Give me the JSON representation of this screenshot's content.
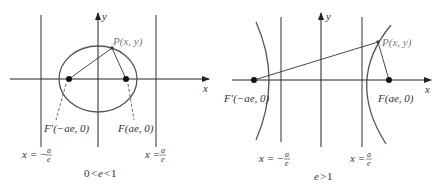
{
  "left_panel": {
    "caption": "0 < e < 1",
    "caption_parts": {
      "zero": "0",
      "lt1": "<",
      "e": "e",
      "lt2": "<",
      "one": "1"
    },
    "x_axis_label": "x",
    "y_axis_label": "y",
    "point_label": "P(x, y)",
    "left_focus_label": "F′(−ae, 0)",
    "right_focus_label": "F(ae, 0)",
    "left_directrix": {
      "lhs": "x = −",
      "num": "a",
      "den": "e"
    },
    "right_directrix": {
      "lhs": "x = ",
      "num": "a",
      "den": "e"
    },
    "curve": "ellipse"
  },
  "right_panel": {
    "caption": "e > 1",
    "caption_parts": {
      "e": "e",
      "gt": ">",
      "one": "1"
    },
    "x_axis_label": "x",
    "y_axis_label": "y",
    "point_label": "P(x, y)",
    "left_focus_label": "F′(−ae, 0)",
    "right_focus_label": "F(ae, 0)",
    "left_directrix": {
      "lhs": "x = −",
      "num": "a",
      "den": "e"
    },
    "right_directrix": {
      "lhs": "x = ",
      "num": "a",
      "den": "e"
    },
    "curve": "hyperbola"
  },
  "colors": {
    "line": "#333333",
    "curve": "#555555",
    "point_label": "#777777"
  }
}
